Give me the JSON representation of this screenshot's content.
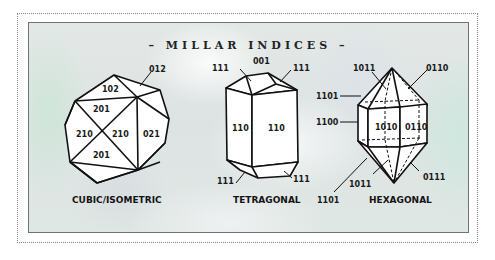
{
  "title": "– MILLAR INDICES –",
  "colors": {
    "line": "#111111",
    "face": "#ffffff",
    "panel_bg": "#e1e6e5",
    "panel_border": "#6f7472",
    "outer_border": "#8a8a8a"
  },
  "crystals": [
    {
      "name": "cubic",
      "caption": "CUBIC/ISOMETRIC",
      "labels": {
        "l012": "012",
        "l102": "102",
        "l201_top": "201",
        "l210_left": "210",
        "l210_mid": "210",
        "l021": "021",
        "l201_bottom": "201"
      }
    },
    {
      "name": "tetragonal",
      "caption": "TETRAGONAL",
      "labels": {
        "l001": "001",
        "l111_tl": "111",
        "l111_tr": "111",
        "l110_left": "110",
        "l110_right": "110",
        "l111_bl": "111",
        "l111_br": "111"
      }
    },
    {
      "name": "hexagonal",
      "caption": "HEXAGONAL",
      "labels": {
        "l1011_top": "1011",
        "l0110_top": "0110",
        "l1101_left": "1101",
        "l1100_left": "1100",
        "l1010_face": "1010",
        "l0110_face": "0110",
        "l1011_bottom": "1011",
        "l1101_bottom": "1101",
        "l0111_bottom": "0111"
      }
    }
  ]
}
